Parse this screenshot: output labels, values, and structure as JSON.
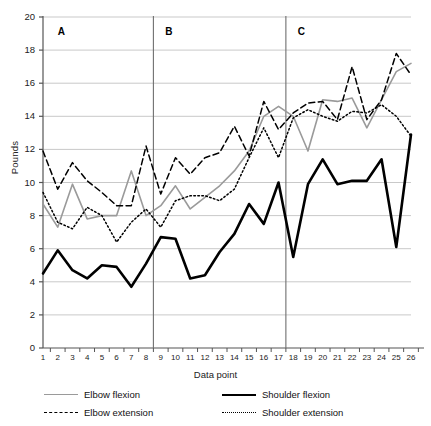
{
  "chart_data": {
    "type": "line",
    "title": "",
    "xlabel": "Data point",
    "ylabel": "Pounds",
    "ylim": [
      0,
      20
    ],
    "yticks": [
      0,
      2,
      4,
      6,
      8,
      10,
      12,
      14,
      16,
      18,
      20
    ],
    "xlim": [
      1,
      26
    ],
    "grid": "horizontal",
    "legend_position": "bottom",
    "x": [
      1,
      2,
      3,
      4,
      5,
      6,
      7,
      8,
      9,
      10,
      11,
      12,
      13,
      14,
      15,
      16,
      17,
      18,
      19,
      20,
      21,
      22,
      23,
      24,
      25,
      26
    ],
    "categories": [
      "1",
      "2",
      "3",
      "4",
      "5",
      "6",
      "7",
      "8",
      "9",
      "10",
      "11",
      "12",
      "13",
      "14",
      "15",
      "16",
      "17",
      "18",
      "19",
      "20",
      "21",
      "22",
      "23",
      "24",
      "25",
      "26"
    ],
    "series": [
      {
        "name": "Elbow flexion",
        "style": "solid",
        "color": "#9a9a9a",
        "width": 1.6,
        "values": [
          8.7,
          7.3,
          9.9,
          7.8,
          8.0,
          8.0,
          10.7,
          8.0,
          8.6,
          9.8,
          8.4,
          9.1,
          9.8,
          10.7,
          11.9,
          14.0,
          14.6,
          14.0,
          11.9,
          15.0,
          14.9,
          15.1,
          13.3,
          15.0,
          16.7,
          17.2
        ]
      },
      {
        "name": "Elbow extension",
        "style": "dashed",
        "color": "#000000",
        "width": 1.5,
        "values": [
          11.9,
          9.6,
          11.2,
          10.1,
          9.4,
          8.6,
          8.6,
          12.2,
          9.3,
          11.5,
          10.5,
          11.5,
          11.8,
          13.4,
          11.6,
          14.9,
          13.2,
          14.2,
          14.8,
          14.9,
          13.8,
          17.0,
          13.8,
          15.0,
          17.8,
          16.5
        ]
      },
      {
        "name": "Shoulder flexion",
        "style": "solid",
        "color": "#000000",
        "width": 2.6,
        "values": [
          4.5,
          5.9,
          4.7,
          4.2,
          5.0,
          4.9,
          3.7,
          5.1,
          6.7,
          6.6,
          4.2,
          4.4,
          5.8,
          6.9,
          8.7,
          7.5,
          10.0,
          5.5,
          9.9,
          11.4,
          9.9,
          10.1,
          10.1,
          11.4,
          6.1,
          12.9
        ]
      },
      {
        "name": "Shoulder extension",
        "style": "dotted",
        "color": "#000000",
        "width": 1.5,
        "values": [
          9.4,
          7.6,
          7.2,
          8.5,
          8.0,
          6.4,
          7.6,
          8.4,
          7.3,
          8.9,
          9.2,
          9.2,
          8.9,
          9.6,
          11.5,
          13.3,
          11.5,
          13.9,
          14.4,
          14.0,
          13.7,
          14.3,
          14.2,
          14.7,
          14.0,
          12.8
        ]
      }
    ],
    "phase_lines": [
      {
        "label": "A",
        "x_at": 1.0,
        "label_x": 2.0,
        "draw_line": false
      },
      {
        "label": "B",
        "x_at": 8.5,
        "label_x": 9.3,
        "draw_line": true
      },
      {
        "label": "C",
        "x_at": 17.5,
        "label_x": 18.3,
        "draw_line": true
      }
    ]
  },
  "legend": {
    "items": [
      {
        "label": "Elbow flexion",
        "swatch": "sw-solid-gray"
      },
      {
        "label": "Shoulder flexion",
        "swatch": "sw-solid-black"
      },
      {
        "label": "Elbow extension",
        "swatch": "sw-dashed"
      },
      {
        "label": "Shoulder extension",
        "swatch": "sw-dotted"
      }
    ]
  },
  "colors": {
    "gray_series": "#9a9a9a",
    "black_series": "#000000",
    "gridline": "#c9c9c9",
    "axis": "#555555",
    "phase_divider": "#6f6f6f",
    "background": "#ffffff"
  }
}
